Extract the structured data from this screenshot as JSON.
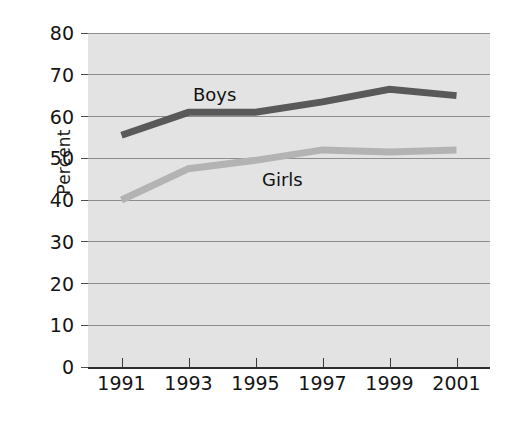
{
  "chart_data": {
    "type": "line",
    "title": "",
    "xlabel": "",
    "ylabel": "Percent",
    "categories": [
      "1991",
      "1993",
      "1995",
      "1997",
      "1999",
      "2001"
    ],
    "x": [
      1991,
      1993,
      1995,
      1997,
      1999,
      2001
    ],
    "xlim": [
      1990,
      2002
    ],
    "ylim": [
      0,
      80
    ],
    "ytick_labels": [
      "0",
      "10",
      "20",
      "30",
      "40",
      "50",
      "60",
      "70",
      "80"
    ],
    "ytick_values": [
      0,
      10,
      20,
      30,
      40,
      50,
      60,
      70,
      80
    ],
    "grid": "horizontal",
    "legend_position": "inline-labels",
    "plot_background": "#e3e3e3",
    "figure_background": "#ffffff",
    "series": [
      {
        "name": "Boys",
        "color": "#595959",
        "values": [
          55.5,
          61,
          61,
          63.5,
          66.5,
          65
        ],
        "label_text": "Boys"
      },
      {
        "name": "Girls",
        "color": "#b3b3b3",
        "values": [
          40,
          47.5,
          49.5,
          52,
          51.5,
          52
        ],
        "label_text": "Girls"
      }
    ]
  },
  "axis": {
    "y_title": "Percent"
  }
}
